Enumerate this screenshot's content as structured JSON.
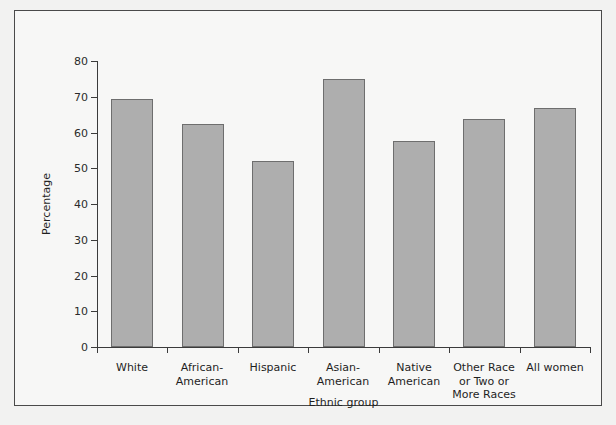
{
  "chart_data": {
    "type": "bar",
    "title": "",
    "xlabel": "Ethnic group",
    "ylabel": "Percentage",
    "categories": [
      "White",
      "African-\nAmerican",
      "Hispanic",
      "Asian-\nAmerican",
      "Native\nAmerican",
      "Other Race\nor Two or\nMore Races",
      "All women"
    ],
    "values": [
      69.5,
      62.3,
      52.0,
      75.0,
      57.6,
      63.8,
      66.8
    ],
    "ylim": [
      0,
      80
    ],
    "yticks": [
      0,
      10,
      20,
      30,
      40,
      50,
      60,
      70,
      80
    ],
    "ytick_labels": [
      "0",
      "10",
      "20",
      "30",
      "40",
      "50",
      "60",
      "70",
      "80"
    ],
    "grid": false,
    "legend": null,
    "bar_color": "#aeaeae",
    "bar_edge_color": "#6e6e6e",
    "axis_color": "#3b3b3b",
    "plot_background": "#f7f7f6",
    "figure_background": "#f2f2f1",
    "frame_color": "#4a4a4a"
  }
}
